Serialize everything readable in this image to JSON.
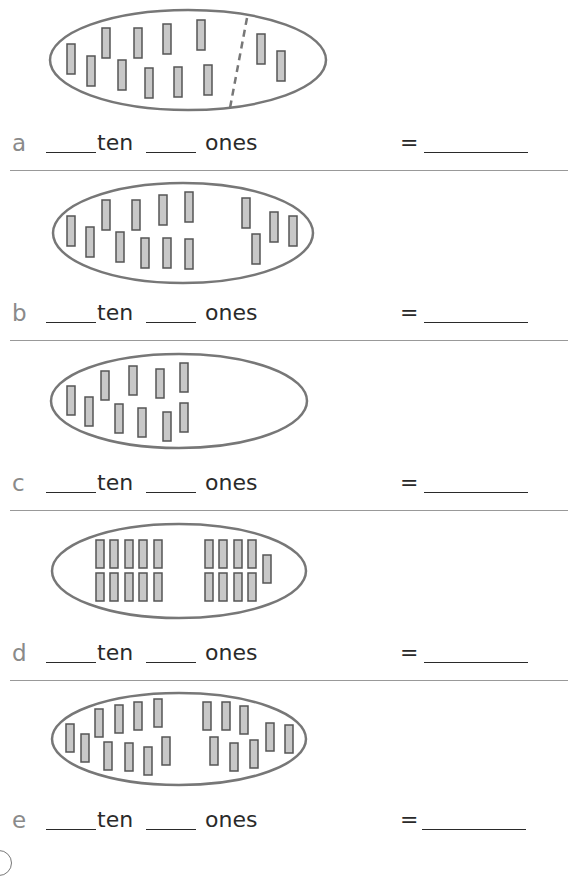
{
  "worksheet": {
    "row_template": {
      "tens_word": "ten",
      "ones_word": "ones",
      "equals": "="
    },
    "colors": {
      "oval_stroke": "#777777",
      "bar_fill": "#c8c8c8",
      "bar_stroke": "#555555",
      "letter": "#8a8a8a",
      "divider": "#999999"
    },
    "problems": [
      {
        "letter": "a",
        "counters_left": 10,
        "counters_right": 2,
        "total_counters": 12,
        "has_dashed_divider": true,
        "layout": "scattered"
      },
      {
        "letter": "b",
        "counters_left": 10,
        "counters_right": 4,
        "total_counters": 14,
        "has_dashed_divider": false,
        "layout": "scattered"
      },
      {
        "letter": "c",
        "counters_left": 10,
        "counters_right": 0,
        "total_counters": 10,
        "has_dashed_divider": false,
        "layout": "scattered"
      },
      {
        "letter": "d",
        "counters_left": 10,
        "counters_right": 9,
        "total_counters": 19,
        "has_dashed_divider": false,
        "layout": "grid"
      },
      {
        "letter": "e",
        "counters_left": 10,
        "counters_right": 8,
        "total_counters": 18,
        "has_dashed_divider": false,
        "layout": "scattered"
      }
    ]
  }
}
